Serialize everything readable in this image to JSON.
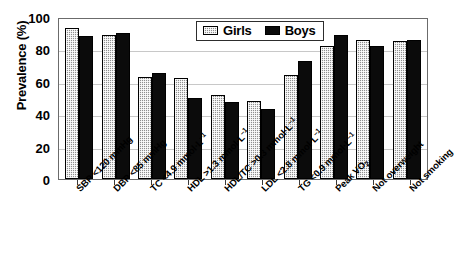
{
  "chart_data": {
    "type": "bar",
    "title": "",
    "subtitle": "",
    "xlabel": "",
    "ylabel": "Prevalence (%)",
    "ylim": [
      0,
      100
    ],
    "yticks": [
      0,
      20,
      40,
      60,
      80,
      100
    ],
    "grid": "horizontal-light",
    "legend_position": "top-center",
    "categories": [
      "SBP <120 mmHg",
      "DBP <85 mmHg",
      "TC <4.9 mmol·L⁻¹",
      "HDL >1.3 mmol·L⁻¹",
      "HDL/TC >0.3 mmol·L⁻¹",
      "LDL <2.8 mmol·L⁻¹",
      "TG <0.9 mmol·L⁻¹",
      "Peak VO₂",
      "Not overweight",
      "Not smoking"
    ],
    "series": [
      {
        "name": "Girls",
        "color": "#8f8f8f",
        "pattern": "checkered",
        "values": [
          93,
          89,
          63,
          62.5,
          52,
          48,
          64,
          82,
          86,
          85
        ]
      },
      {
        "name": "Boys",
        "color": "#0b0b0b",
        "pattern": "solid",
        "values": [
          88,
          90,
          65.5,
          50,
          47.5,
          43.5,
          73,
          89,
          82,
          86
        ]
      }
    ]
  },
  "axis": {
    "y_tick_labels": [
      "100",
      "80",
      "60",
      "40",
      "20",
      "0"
    ]
  },
  "legend": {
    "items": [
      {
        "label": "Girls"
      },
      {
        "label": "Boys"
      }
    ]
  },
  "x_label_parts": [
    {
      "main": "SBP <120 mmHg",
      "sup": "",
      "sub": ""
    },
    {
      "main": "DBP <85 mmHg",
      "sup": "",
      "sub": ""
    },
    {
      "main": "TC <4.9 mmol·L",
      "sup": "–1",
      "sub": ""
    },
    {
      "main": "HDL >1.3 mmol·L",
      "sup": "–1",
      "sub": ""
    },
    {
      "main": "HDL/TC >0.3 mmol·L",
      "sup": "–1",
      "sub": ""
    },
    {
      "main": "LDL <2.8 mmol·L",
      "sup": "–1",
      "sub": ""
    },
    {
      "main": "TG <0.9 mmol·L",
      "sup": "–1",
      "sub": ""
    },
    {
      "main": "Peak VO",
      "sup": "",
      "sub": "2"
    },
    {
      "main": "Not overweight",
      "sup": "",
      "sub": ""
    },
    {
      "main": "Not smoking",
      "sup": "",
      "sub": ""
    }
  ],
  "colors": {
    "girls": "#8f8f8f",
    "boys": "#0b0b0b",
    "frame": "#6b6b6b",
    "grid": "#c8c8c8",
    "text": "#000000"
  }
}
